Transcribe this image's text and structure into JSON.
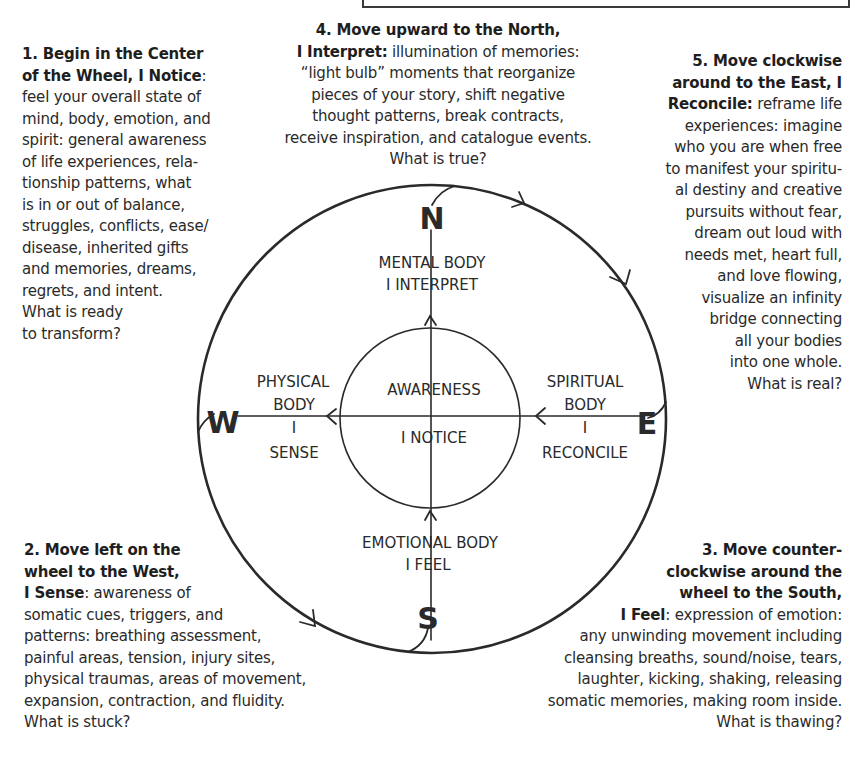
{
  "title_box": {
    "visible": true
  },
  "steps": [
    {
      "id": "center",
      "heading": "1. Begin in the Center of the Wheel, I Notice",
      "lines_bold": [
        "1. Begin in the Center",
        "of the Wheel, I Notice"
      ],
      "lines": [
        "feel your overall state of",
        "mind, body, emotion, and",
        "spirit: general awareness",
        "of life experiences, rela-",
        "tionship patterns, what",
        "is in or out of balance,",
        "struggles, conflicts, ease/",
        "disease, inherited gifts",
        "and memories, dreams,",
        "regrets, and intent.",
        "What is ready",
        "to transform?"
      ]
    },
    {
      "id": "west",
      "lines_bold": [
        "2. Move left on the",
        "wheel to the West,",
        "I Sense"
      ],
      "lines": [
        ": awareness of",
        "somatic cues, triggers, and",
        "patterns: breathing assessment,",
        "painful areas, tension, injury sites,",
        "physical traumas, areas of movement,",
        "expansion, contraction, and fluidity.",
        "What is stuck?"
      ]
    },
    {
      "id": "south",
      "lines_bold": [
        "3. Move counter-",
        "clockwise around the",
        "wheel to the South,",
        "I Feel"
      ],
      "lines": [
        ": expression of emotion:",
        "any unwinding movement including",
        "cleansing breaths, sound/noise, tears,",
        "laughter, kicking, shaking, releasing",
        "somatic memories, making room inside.",
        "What is thawing?"
      ]
    },
    {
      "id": "north",
      "lines_bold": [
        "4. Move upward to the North,",
        "I Interpret:"
      ],
      "lines": [
        " illumination of memories:",
        "“light bulb” moments that reorganize",
        "pieces of your story, shift negative",
        "thought patterns, break contracts,",
        "receive inspiration, and catalogue events.",
        "What is true?"
      ]
    },
    {
      "id": "east",
      "lines_bold": [
        "5. Move clockwise",
        "around to the East, I",
        "Reconcile:"
      ],
      "lines": [
        " reframe life",
        "experiences: imagine",
        "who you are when free",
        "to manifest your spiritu-",
        "al destiny and creative",
        "pursuits without fear,",
        "dream out loud with",
        "needs met, heart full,",
        "and love flowing,",
        "visualize an infinity",
        "bridge connecting",
        "all your bodies",
        "into one whole.",
        "What is real?"
      ]
    }
  ],
  "wheel": {
    "directions": {
      "north": "N",
      "south": "S",
      "east": "E",
      "west": "W"
    },
    "center": {
      "line1": "AWARENESS",
      "line2": "I NOTICE"
    },
    "north_label": {
      "line1": "MENTAL BODY",
      "line2": "I INTERPRET"
    },
    "south_label": {
      "line1": "EMOTIONAL BODY",
      "line2": "I FEEL"
    },
    "west_label": {
      "line1": "PHYSICAL",
      "line2": "BODY",
      "line3": "I",
      "line4": "SENSE"
    },
    "east_label": {
      "line1": "SPIRITUAL",
      "line2": "BODY",
      "line3": "I",
      "line4": "RECONCILE"
    },
    "stroke_color": "#2a2a2a"
  }
}
